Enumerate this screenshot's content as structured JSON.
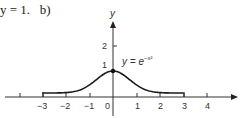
{
  "header": {
    "fragment_text": "y = 1.",
    "part_label": "b)"
  },
  "chart_data": {
    "type": "line",
    "title": "",
    "equation_label": "y = e^{-x^2}",
    "equation_base": "y = e",
    "equation_exponent": "−x²",
    "xlabel": "",
    "ylabel": "y",
    "xlim": [
      -4.5,
      5.3
    ],
    "ylim": [
      -0.7,
      2.9
    ],
    "x_ticks": [
      -4,
      -3,
      -2,
      -1,
      0,
      1,
      2,
      3,
      4
    ],
    "x_tick_labels": [
      "−3",
      "−2",
      "−1",
      "0",
      "1",
      "2",
      "3",
      "4"
    ],
    "y_ticks": [
      1,
      2
    ],
    "y_tick_labels": [
      "1",
      "2"
    ],
    "grid": false,
    "legend": null,
    "series": [
      {
        "name": "y = e^{-x^2}",
        "x": [
          -3,
          -2.5,
          -2,
          -1.5,
          -1,
          -0.5,
          0,
          0.5,
          1,
          1.5,
          2,
          2.5,
          3
        ],
        "values": [
          0.0001,
          0.0019,
          0.0183,
          0.1054,
          0.3679,
          0.7788,
          1.0,
          0.7788,
          0.3679,
          0.1054,
          0.0183,
          0.0019,
          0.0001
        ]
      }
    ],
    "annotations": [
      {
        "type": "point",
        "x": 0,
        "y": 1,
        "label": "maximum (0, 1)"
      },
      {
        "type": "endpoint-bar",
        "x": -3
      },
      {
        "type": "endpoint-bar",
        "x": 3
      }
    ],
    "colors": {
      "curve": "#1a1a1a",
      "axis": "#333333"
    }
  }
}
